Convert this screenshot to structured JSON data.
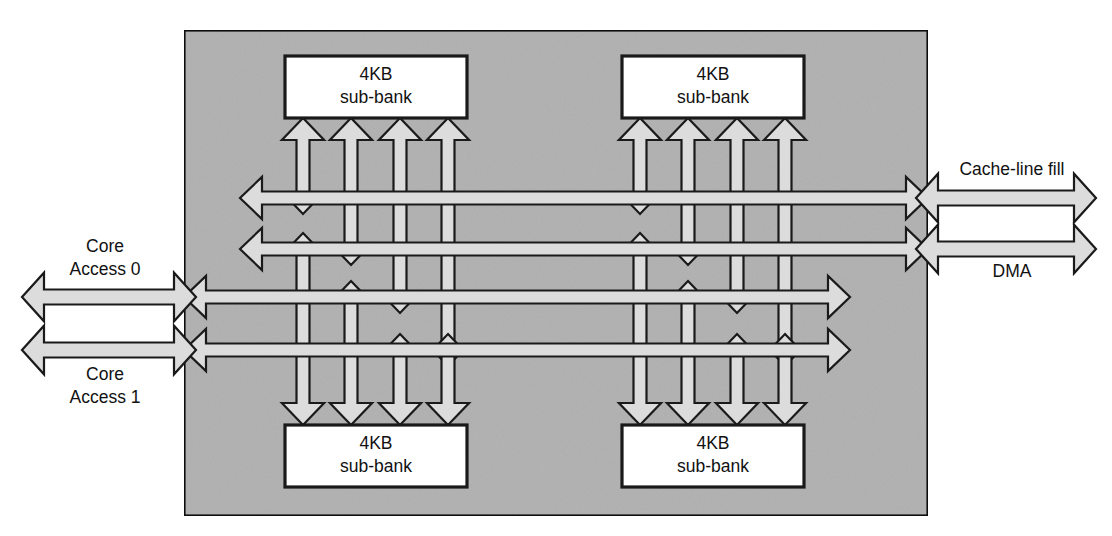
{
  "diagram": {
    "region": {
      "name": "cache-region",
      "fill_color": "#b4b4b4",
      "border_color": "#111111",
      "x": 184,
      "y": 30,
      "width": 744,
      "height": 486
    },
    "sub_banks": [
      {
        "id": "top-left",
        "line1": "4KB",
        "line2": "sub-bank",
        "x": 285,
        "y": 56,
        "width": 182,
        "height": 62
      },
      {
        "id": "top-right",
        "line1": "4KB",
        "line2": "sub-bank",
        "x": 622,
        "y": 56,
        "width": 182,
        "height": 62
      },
      {
        "id": "bottom-left",
        "line1": "4KB",
        "line2": "sub-bank",
        "x": 285,
        "y": 425,
        "width": 182,
        "height": 62
      },
      {
        "id": "bottom-right",
        "line1": "4KB",
        "line2": "sub-bank",
        "x": 622,
        "y": 425,
        "width": 182,
        "height": 62
      }
    ],
    "buses": [
      {
        "id": "bus-0",
        "y": 198,
        "x_left": 240,
        "x_right": 928,
        "left_head": true,
        "right_head": true,
        "thickness": 13
      },
      {
        "id": "bus-1",
        "y": 249,
        "x_left": 240,
        "x_right": 928,
        "left_head": true,
        "right_head": true,
        "thickness": 13
      },
      {
        "id": "bus-2",
        "y": 297,
        "x_left": 184,
        "x_right": 850,
        "left_head": true,
        "right_head": true,
        "thickness": 13
      },
      {
        "id": "bus-3",
        "y": 350,
        "x_left": 184,
        "x_right": 850,
        "left_head": true,
        "right_head": true,
        "thickness": 13
      }
    ],
    "external_ports": [
      {
        "id": "core-access-0",
        "label_line1": "Core",
        "label_line2": "Access 0",
        "label_x": 105,
        "label_y": 252,
        "label_position": "above",
        "y": 297,
        "x_left": 22,
        "x_right": 196
      },
      {
        "id": "core-access-1",
        "label_line1": "Core",
        "label_line2": "Access 1",
        "label_x": 105,
        "label_y": 380,
        "label_position": "below",
        "y": 350,
        "x_left": 22,
        "x_right": 196
      },
      {
        "id": "cache-line-fill",
        "label_line1": "Cache-line fill",
        "label_line2": "",
        "label_x": 1012,
        "label_y": 175,
        "label_position": "above",
        "y": 198,
        "x_left": 916,
        "x_right": 1096
      },
      {
        "id": "dma",
        "label_line1": "DMA",
        "label_line2": "",
        "label_x": 1012,
        "label_y": 277,
        "label_position": "below",
        "y": 249,
        "x_left": 916,
        "x_right": 1096
      }
    ],
    "vertical_columns": {
      "left_group_x": [
        303,
        351,
        400,
        448
      ],
      "right_group_x": [
        640,
        688,
        737,
        785
      ],
      "top_box_bottom_y": 118,
      "bottom_box_top_y": 425
    },
    "vertical_links": [
      {
        "group": "left",
        "col": 0,
        "from": "top-box",
        "to_bus": 0,
        "direction": "both"
      },
      {
        "group": "left",
        "col": 1,
        "from": "top-box",
        "to_bus": 1,
        "direction": "both"
      },
      {
        "group": "left",
        "col": 2,
        "from": "top-box",
        "to_bus": 2,
        "direction": "both"
      },
      {
        "group": "left",
        "col": 3,
        "from": "top-box",
        "to_bus": 3,
        "direction": "both"
      },
      {
        "group": "left",
        "col": 0,
        "from": "bottom-box",
        "to_bus": 1,
        "direction": "both"
      },
      {
        "group": "left",
        "col": 1,
        "from": "bottom-box",
        "to_bus": 2,
        "direction": "both"
      },
      {
        "group": "left",
        "col": 2,
        "from": "bottom-box",
        "to_bus": 3,
        "direction": "both"
      },
      {
        "group": "left",
        "col": 3,
        "from": "bottom-box",
        "to_bus": 3,
        "direction": "both"
      },
      {
        "group": "right",
        "col": 0,
        "from": "top-box",
        "to_bus": 0,
        "direction": "both"
      },
      {
        "group": "right",
        "col": 1,
        "from": "top-box",
        "to_bus": 1,
        "direction": "both"
      },
      {
        "group": "right",
        "col": 2,
        "from": "top-box",
        "to_bus": 2,
        "direction": "both"
      },
      {
        "group": "right",
        "col": 3,
        "from": "top-box",
        "to_bus": 3,
        "direction": "both"
      },
      {
        "group": "right",
        "col": 0,
        "from": "bottom-box",
        "to_bus": 1,
        "direction": "both"
      },
      {
        "group": "right",
        "col": 1,
        "from": "bottom-box",
        "to_bus": 2,
        "direction": "both"
      },
      {
        "group": "right",
        "col": 2,
        "from": "bottom-box",
        "to_bus": 3,
        "direction": "both"
      },
      {
        "group": "right",
        "col": 3,
        "from": "bottom-box",
        "to_bus": 3,
        "direction": "both"
      }
    ],
    "colors": {
      "arrow_fill": "#dcdcdc",
      "arrow_stroke": "#1a1a1a",
      "region_fill": "#b4b4b4",
      "box_fill": "#ffffff",
      "text": "#111111"
    }
  }
}
